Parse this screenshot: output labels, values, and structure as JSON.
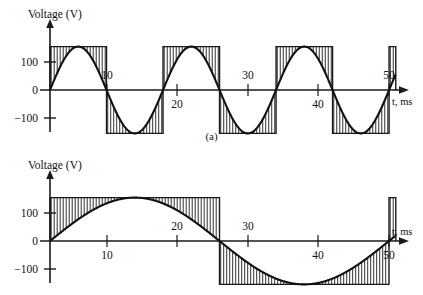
{
  "figure": {
    "caption_a": "(a)",
    "caption_b": "(b)"
  },
  "panel_a": {
    "y_axis_title": "Voltage (V)",
    "x_axis_title": "t, ms",
    "y_ticks": [
      "100",
      "0",
      "−100"
    ],
    "x_ticks": [
      "10",
      "20",
      "30",
      "40",
      "50"
    ]
  },
  "panel_b": {
    "y_axis_title": "Voltage (V)",
    "x_axis_title": "t, ms",
    "y_ticks": [
      "100",
      "0",
      "−100"
    ],
    "x_ticks": [
      "10",
      "20",
      "30",
      "40",
      "50"
    ]
  },
  "chart_data": [
    {
      "type": "line",
      "id": "panel-a",
      "title": "(a)",
      "xlabel": "t, ms",
      "ylabel": "Voltage (V)",
      "xlim": [
        0,
        52
      ],
      "ylim": [
        -175,
        175
      ],
      "x_ticks": [
        10,
        20,
        30,
        40,
        50
      ],
      "y_ticks": [
        100,
        0,
        -100
      ],
      "grid": false,
      "legend": null,
      "waveform": {
        "shape": "sine",
        "amplitude": 155,
        "period_ms": 16.67,
        "frequency_hz": 60,
        "phase_deg": 0,
        "start_ms": 0,
        "end_ms": 51
      },
      "shading": {
        "style": "vertical-hatch",
        "description": "vertical line hatching between sine curve and flat rail at peak amplitude over each half cycle",
        "rail_levels": [
          155,
          -155
        ],
        "hatch_spacing_px": 3
      },
      "series": [
        {
          "name": "v(t)",
          "x": [
            0,
            1,
            2,
            3,
            4,
            5,
            6,
            7,
            8,
            9,
            10,
            11,
            12,
            13,
            14,
            15,
            16,
            17,
            18,
            19,
            20,
            21,
            22,
            23,
            24,
            25,
            26,
            27,
            28,
            29,
            30,
            31,
            32,
            33,
            34,
            35,
            36,
            37,
            38,
            39,
            40,
            41,
            42,
            43,
            44,
            45,
            46,
            47,
            48,
            49,
            50
          ],
          "values": [
            0,
            56,
            106,
            141,
            154,
            145,
            114,
            68,
            13,
            -44,
            -95,
            -135,
            -154,
            -150,
            -123,
            -80,
            -26,
            31,
            86,
            128,
            152,
            152,
            130,
            90,
            38,
            -19,
            -74,
            -119,
            -147,
            -155,
            -139,
            -102,
            -51,
            7,
            63,
            111,
            143,
            155,
            144,
            112,
            65,
            9,
            -48,
            -99,
            -137,
            -154,
            -149,
            -121,
            -77,
            -22,
            34
          ]
        }
      ]
    },
    {
      "type": "line",
      "id": "panel-b",
      "title": "(b)",
      "xlabel": "t, ms",
      "ylabel": "Voltage (V)",
      "xlim": [
        0,
        52
      ],
      "ylim": [
        -175,
        175
      ],
      "x_ticks": [
        10,
        20,
        30,
        40,
        50
      ],
      "y_ticks": [
        100,
        0,
        -100
      ],
      "grid": false,
      "legend": null,
      "waveform": {
        "shape": "sine",
        "amplitude": 155,
        "period_ms": 50,
        "frequency_hz": 20,
        "phase_deg": 0,
        "start_ms": 0,
        "end_ms": 51
      },
      "shading": {
        "style": "vertical-hatch",
        "description": "vertical line hatching between sine curve and flat rail at peak amplitude over each half cycle",
        "rail_levels": [
          155,
          -155
        ],
        "hatch_spacing_px": 3
      },
      "series": [
        {
          "name": "v(t)",
          "x": [
            0,
            2,
            4,
            6,
            8,
            10,
            12,
            14,
            16,
            18,
            20,
            22,
            24,
            26,
            28,
            30,
            32,
            34,
            36,
            38,
            40,
            42,
            44,
            46,
            48,
            50
          ],
          "values": [
            0,
            38,
            74,
            105,
            131,
            147,
            155,
            153,
            141,
            121,
            91,
            56,
            19,
            -19,
            -56,
            -91,
            -121,
            -141,
            -153,
            -155,
            -147,
            -131,
            -105,
            -74,
            -38,
            0
          ]
        }
      ]
    }
  ]
}
